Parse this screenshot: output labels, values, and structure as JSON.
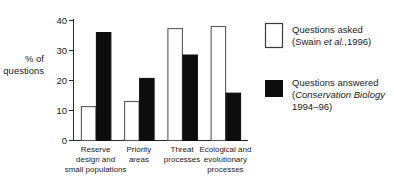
{
  "chart_data": {
    "type": "bar",
    "title": "",
    "xlabel": "",
    "ylabel": "% of questions",
    "ylim": [
      0,
      40
    ],
    "yticks": [
      0,
      10,
      20,
      30,
      40
    ],
    "ytick_labels": [
      "0",
      "10",
      "20",
      "30",
      "40"
    ],
    "grid": false,
    "legend_position": "right",
    "categories": [
      "Reserve design and small populations",
      "Priority areas",
      "Threat processes",
      "Ecological and evolutionary processes"
    ],
    "category_lines": [
      [
        "Reserve",
        "design and",
        "small populations"
      ],
      [
        "Priority",
        "areas"
      ],
      [
        "Threat",
        "processes"
      ],
      [
        "Ecological and",
        "evolutionary",
        "processes"
      ]
    ],
    "series": [
      {
        "name": "Questions asked",
        "style": "open",
        "color": "#ffffff",
        "edge_color": "#585858",
        "values": [
          11.3,
          13.0,
          37.3,
          38.0
        ]
      },
      {
        "name": "Questions answered",
        "style": "filled",
        "color": "#0d0d0d",
        "edge_color": "#0d0d0d",
        "values": [
          36.0,
          20.7,
          28.5,
          15.8
        ]
      }
    ]
  },
  "axis": {
    "y_label_line1": "% of",
    "y_label_line2": "questions",
    "tick_labels": [
      "40",
      "30",
      "20",
      "10",
      "0"
    ]
  },
  "legend": {
    "entries": [
      {
        "swatch": "open-square",
        "line1": "Questions asked",
        "line2_pre": "(Swain ",
        "line2_italic": "et al.",
        "line2_post": ",1996)",
        "line3": ""
      },
      {
        "swatch": "filled-square",
        "line1": "Questions answered",
        "line2_pre": "(",
        "line2_italic": "Conservation Biology",
        "line2_post": "",
        "line3": "1994–96)"
      }
    ]
  }
}
